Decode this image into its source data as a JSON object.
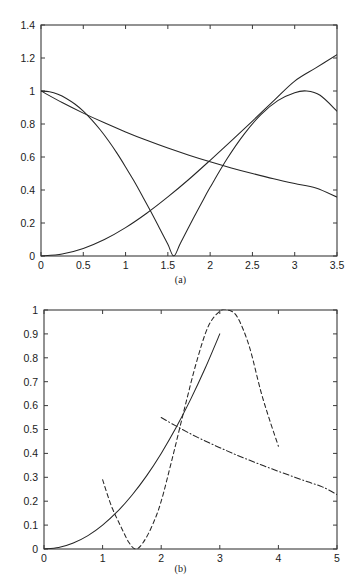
{
  "figure": {
    "panels": [
      {
        "id": "a",
        "caption": "(a)",
        "chart_index": 0
      },
      {
        "id": "b",
        "caption": "(b)",
        "chart_index": 1
      }
    ]
  },
  "chart_data": [
    {
      "type": "line",
      "panel": "(a)",
      "title": "",
      "xlabel": "",
      "ylabel": "",
      "xlim": [
        0,
        3.5
      ],
      "ylim": [
        0,
        1.4
      ],
      "grid": false,
      "legend": null,
      "xticks": [
        "0",
        "0.5",
        "1",
        "1.5",
        "2",
        "2.5",
        "3",
        "3.5"
      ],
      "xtick_values": [
        0,
        0.5,
        1,
        1.5,
        2,
        2.5,
        3,
        3.5
      ],
      "yticks": [
        "0",
        "0.2",
        "0.4",
        "0.6",
        "0.8",
        "1",
        "1.2",
        "1.4"
      ],
      "ytick_values": [
        0,
        0.2,
        0.4,
        0.6,
        0.8,
        1.0,
        1.2,
        1.4
      ],
      "series": [
        {
          "name": "curve-cosine",
          "style": "solid",
          "x": [
            0,
            0.1,
            0.2,
            0.3,
            0.4,
            0.5,
            0.6,
            0.7,
            0.8,
            0.9,
            1.0,
            1.1,
            1.2,
            1.3,
            1.4,
            1.5,
            1.5708,
            1.65,
            1.8,
            1.9,
            2.0,
            2.2,
            2.4,
            2.6,
            2.8,
            3.0,
            3.1416,
            3.3,
            3.5
          ],
          "y": [
            1.0,
            0.995,
            0.98,
            0.955,
            0.921,
            0.878,
            0.825,
            0.765,
            0.697,
            0.622,
            0.54,
            0.454,
            0.362,
            0.268,
            0.17,
            0.071,
            0.0,
            0.079,
            0.227,
            0.323,
            0.416,
            0.589,
            0.737,
            0.857,
            0.942,
            0.99,
            1.0,
            0.974,
            0.878
          ]
        },
        {
          "name": "curve-decaying",
          "style": "solid",
          "x": [
            0,
            0.25,
            0.5,
            0.75,
            1.0,
            1.25,
            1.5,
            1.75,
            2.0,
            2.25,
            2.5,
            2.75,
            3.0,
            3.25,
            3.5
          ],
          "y": [
            1.0,
            0.93,
            0.866,
            0.807,
            0.752,
            0.701,
            0.654,
            0.611,
            0.571,
            0.534,
            0.5,
            0.468,
            0.439,
            0.412,
            0.357
          ]
        },
        {
          "name": "curve-rising",
          "style": "solid",
          "x": [
            0,
            0.25,
            0.5,
            0.75,
            1.0,
            1.25,
            1.5,
            1.75,
            2.0,
            2.25,
            2.5,
            2.75,
            3.0,
            3.25,
            3.5
          ],
          "y": [
            0.0,
            0.012,
            0.046,
            0.1,
            0.172,
            0.259,
            0.358,
            0.465,
            0.58,
            0.698,
            0.818,
            0.94,
            1.06,
            1.14,
            1.22
          ]
        }
      ]
    },
    {
      "type": "line",
      "panel": "(b)",
      "title": "",
      "xlabel": "",
      "ylabel": "",
      "xlim": [
        0,
        5
      ],
      "ylim": [
        0,
        1
      ],
      "grid": false,
      "legend": null,
      "xticks": [
        "0",
        "1",
        "2",
        "3",
        "4",
        "5"
      ],
      "xtick_values": [
        0,
        1,
        2,
        3,
        4,
        5
      ],
      "yticks": [
        "0",
        "0.1",
        "0.2",
        "0.3",
        "0.4",
        "0.5",
        "0.6",
        "0.7",
        "0.8",
        "0.9",
        "1"
      ],
      "ytick_values": [
        0,
        0.1,
        0.2,
        0.3,
        0.4,
        0.5,
        0.6,
        0.7,
        0.8,
        0.9,
        1.0
      ],
      "series": [
        {
          "name": "curve-solid-rising",
          "style": "solid",
          "x": [
            0,
            0.25,
            0.5,
            0.75,
            1.0,
            1.25,
            1.5,
            1.75,
            2.0,
            2.25,
            2.5,
            2.75,
            3.0
          ],
          "y": [
            0.0,
            0.006,
            0.025,
            0.056,
            0.1,
            0.156,
            0.225,
            0.306,
            0.4,
            0.506,
            0.625,
            0.756,
            0.9
          ]
        },
        {
          "name": "curve-dashed-v",
          "style": "dashed",
          "x": [
            1.0,
            1.15,
            1.3,
            1.45,
            1.5708,
            1.7,
            1.85,
            2.0,
            2.2,
            2.4,
            2.6,
            2.8,
            3.0,
            3.1416,
            3.3,
            3.5,
            3.7,
            3.85,
            4.0
          ],
          "y": [
            0.29,
            0.18,
            0.1,
            0.027,
            0.0,
            0.03,
            0.1,
            0.2,
            0.39,
            0.59,
            0.78,
            0.93,
            0.995,
            1.0,
            0.97,
            0.85,
            0.66,
            0.54,
            0.43
          ]
        },
        {
          "name": "curve-dashdot-decaying",
          "style": "dashdot",
          "x": [
            2.0,
            2.25,
            2.5,
            2.75,
            3.0,
            3.25,
            3.5,
            3.75,
            4.0,
            4.25,
            4.5,
            4.75,
            5.0
          ],
          "y": [
            0.55,
            0.515,
            0.482,
            0.452,
            0.424,
            0.397,
            0.372,
            0.348,
            0.325,
            0.303,
            0.281,
            0.26,
            0.228
          ]
        }
      ]
    }
  ]
}
